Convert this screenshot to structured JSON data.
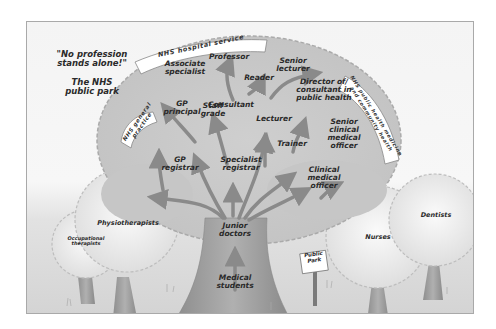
{
  "title_quote": "\"No profession\nstands alone!\"",
  "subtitle": "The NHS\npublic park",
  "banners": {
    "hospital": "NHS hospital service",
    "general_practice": "NHS general\npractice",
    "public_health": "NHS public health medicine\nand community health"
  },
  "main_tree": {
    "roots": "Medical\nstudents",
    "trunk": "Junior\ndoctors",
    "branches": {
      "gp_registrar": "GP\nregistrar",
      "gp_principal": "GP\nprincipal",
      "staff_grade": "Staff\ngrade",
      "associate_specialist": "Associate\nspecialist",
      "specialist_registrar": "Specialist\nregistrar",
      "consultant": "Consultant",
      "professor": "Professor",
      "reader": "Reader",
      "senior_lecturer": "Senior\nlecturer",
      "lecturer": "Lecturer",
      "trainer": "Trainer",
      "director_public_health": "Director of/\nconsultant in\npublic health",
      "senior_clinical_medical_officer": "Senior\nclinical\nmedical\nofficer",
      "clinical_medical_officer": "Clinical\nmedical\nofficer"
    }
  },
  "other_trees": {
    "occupational_therapists": "Occupational\ntherapists",
    "physiotherapists": "Physiotherapists",
    "nurses": "Nurses",
    "dentists": "Dentists"
  },
  "sign": "Public\nPark",
  "colors": {
    "crown": "#c8c8c8",
    "crown_edge": "#a8a8a8",
    "small_crown": "#e6e6e6",
    "trunk": "#9a9a9a",
    "arrow": "#8a8a8a",
    "text": "#2a2a2a"
  }
}
